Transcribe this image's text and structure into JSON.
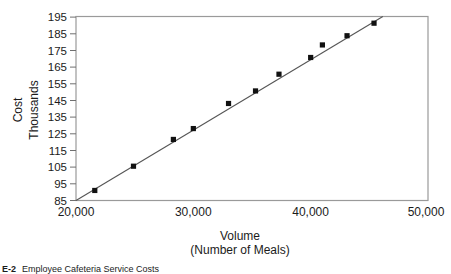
{
  "figure": {
    "caption_label": "E-2",
    "caption_text": "Employee Cafeteria Service Costs"
  },
  "chart_data": {
    "type": "scatter",
    "title": "",
    "xlabel": "Volume",
    "xlabel_sub": "(Number of Meals)",
    "ylabel": "Cost",
    "ylabel_sub": "Thousands",
    "xlim": [
      20000,
      50000
    ],
    "ylim": [
      85,
      195
    ],
    "xticks": [
      20000,
      30000,
      40000,
      50000
    ],
    "xtick_labels": [
      "20,000",
      "30,000",
      "40,000",
      "50,000"
    ],
    "yticks": [
      85,
      95,
      105,
      115,
      125,
      135,
      145,
      155,
      165,
      175,
      185,
      195
    ],
    "ytick_labels": [
      "85",
      "95",
      "105",
      "115",
      "125",
      "135",
      "145",
      "155",
      "165",
      "175",
      "185",
      "195"
    ],
    "grid": false,
    "legend": null,
    "marker": "square",
    "marker_color": "#111111",
    "line_color": "#555555",
    "axis_color": "#8a8a8a",
    "series": [
      {
        "name": "Cafeteria cost observations",
        "type": "scatter",
        "points": [
          {
            "x": 21600,
            "y": 91.0
          },
          {
            "x": 24900,
            "y": 105.5
          },
          {
            "x": 28300,
            "y": 121.5
          },
          {
            "x": 30000,
            "y": 128.0
          },
          {
            "x": 33000,
            "y": 143.0
          },
          {
            "x": 35300,
            "y": 150.5
          },
          {
            "x": 37300,
            "y": 160.5
          },
          {
            "x": 40000,
            "y": 170.5
          },
          {
            "x": 41000,
            "y": 178.0
          },
          {
            "x": 43100,
            "y": 183.5
          },
          {
            "x": 45400,
            "y": 191.0
          }
        ]
      },
      {
        "name": "Regression line",
        "type": "line",
        "points": [
          {
            "x": 20000,
            "y": 85.0
          },
          {
            "x": 46150,
            "y": 195.0
          }
        ]
      }
    ]
  }
}
